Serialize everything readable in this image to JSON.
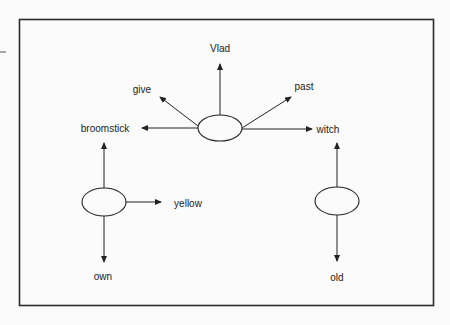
{
  "diagram": {
    "type": "semantic-network",
    "colors": {
      "background": "#fbfbfb",
      "line": "#222222",
      "text": "#1a1a1a"
    },
    "nodes": [
      {
        "id": "center",
        "shape": "ellipse",
        "label": ""
      },
      {
        "id": "left",
        "shape": "ellipse",
        "label": ""
      },
      {
        "id": "right",
        "shape": "ellipse",
        "label": ""
      }
    ],
    "labels": {
      "vlad": "Vlad",
      "give": "give",
      "past": "past",
      "broomstick": "broomstick",
      "witch": "witch",
      "yellow": "yellow",
      "own": "own",
      "old": "old"
    },
    "edges": [
      {
        "from": "center",
        "to": "Vlad"
      },
      {
        "from": "center",
        "to": "give"
      },
      {
        "from": "center",
        "to": "past"
      },
      {
        "from": "center",
        "to": "broomstick"
      },
      {
        "from": "center",
        "to": "witch"
      },
      {
        "from": "left",
        "to": "broomstick"
      },
      {
        "from": "left",
        "to": "yellow"
      },
      {
        "from": "left",
        "to": "own"
      },
      {
        "from": "right",
        "to": "witch"
      },
      {
        "from": "right",
        "to": "old"
      }
    ]
  }
}
